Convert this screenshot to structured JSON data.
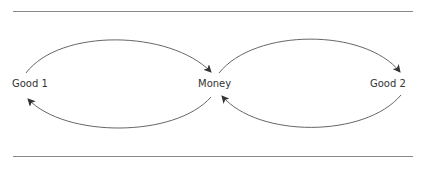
{
  "diagram": {
    "type": "flow-cycle",
    "nodes": [
      {
        "id": "good1",
        "label": "Good 1"
      },
      {
        "id": "money",
        "label": "Money"
      },
      {
        "id": "good2",
        "label": "Good 2"
      }
    ],
    "edges": [
      {
        "from": "good1",
        "to": "money",
        "position": "upper-left"
      },
      {
        "from": "money",
        "to": "good1",
        "position": "lower-left"
      },
      {
        "from": "money",
        "to": "good2",
        "position": "upper-right"
      },
      {
        "from": "good2",
        "to": "money",
        "position": "lower-right"
      }
    ],
    "colors": {
      "line": "#555555",
      "rule": "#8a8a8a",
      "text": "#333333"
    }
  }
}
